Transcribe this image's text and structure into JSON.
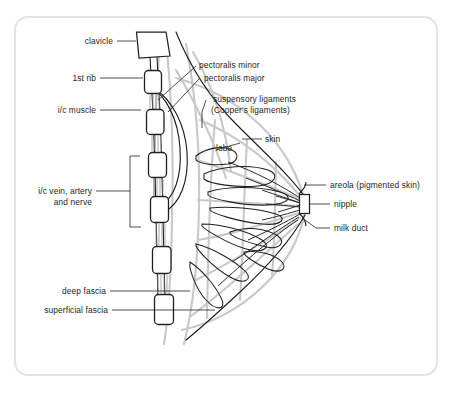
{
  "figure": {
    "title_visible": false,
    "colors": {
      "outline_dark": "#231f20",
      "ligament_gray": "#c8c8c8",
      "card_border": "#e3e3e3",
      "background": "#ffffff"
    }
  },
  "labels": {
    "clavicle": "clavicle",
    "first_rib": "1st rib",
    "ic_muscle": "i/c muscle",
    "ic_vessels_line1": "i/c vein, artery",
    "ic_vessels_line2": "and nerve",
    "deep_fascia": "deep fascia",
    "superficial_fascia": "superficial fascia",
    "pectoralis_minor": "pectoralis minor",
    "pectoralis_major": "pectoralis major",
    "suspensory_line1": "suspensory ligaments",
    "suspensory_line2": "(Cooper's ligaments)",
    "skin": "skin",
    "lobe": "lobe",
    "areola": "areola (pigmented skin)",
    "nipple": "nipple",
    "milk_duct": "milk duct"
  }
}
